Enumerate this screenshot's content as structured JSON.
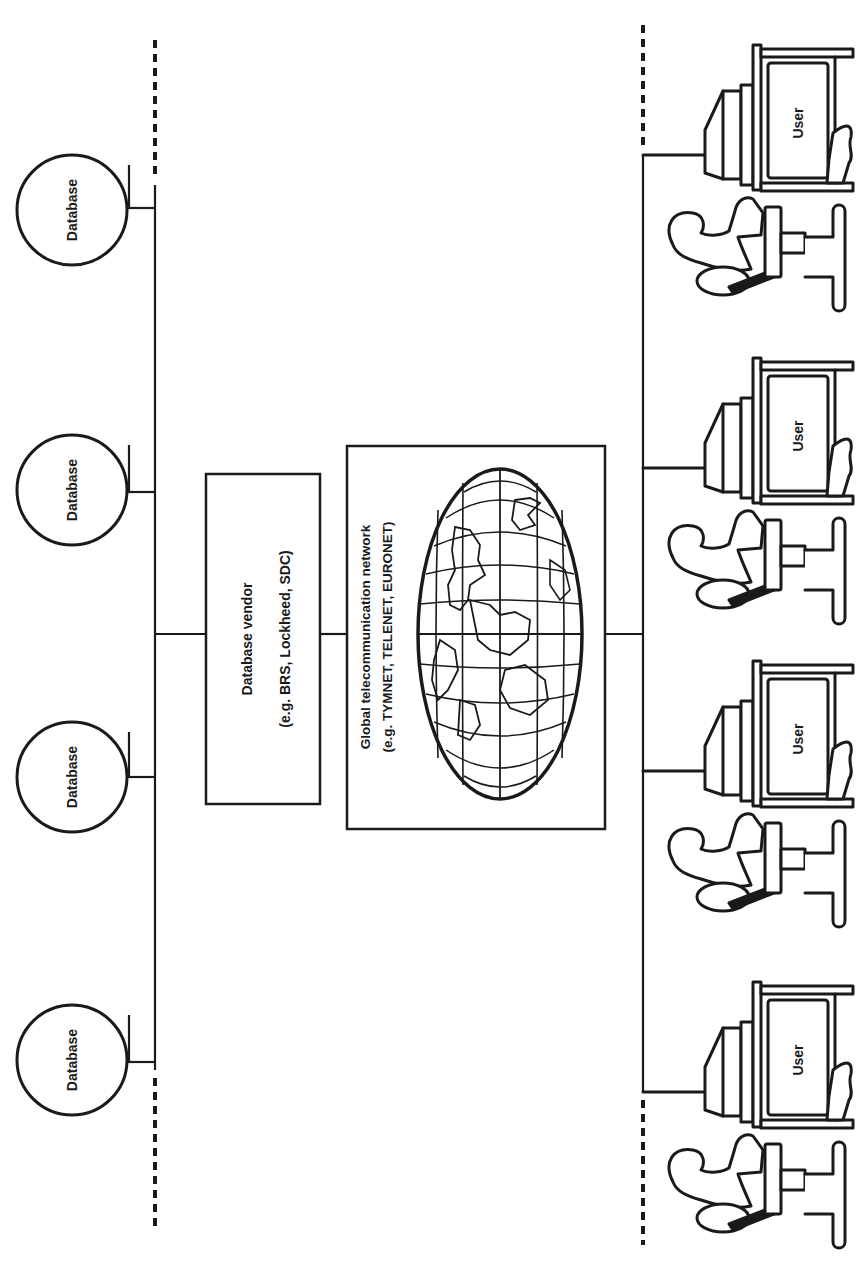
{
  "diagram": {
    "orientation": "rotated-90-ccw",
    "colors": {
      "ink": "#1a1a1a",
      "background": "#ffffff"
    },
    "databases": [
      {
        "label": "Database"
      },
      {
        "label": "Database"
      },
      {
        "label": "Database"
      },
      {
        "label": "Database"
      }
    ],
    "vendor": {
      "title": "Database vendor",
      "examples": "(e.g. BRS, Lockheed, SDC)"
    },
    "network": {
      "title": "Global telecommunication network",
      "examples": "(e.g. TYMNET, TELENET, EURONET)",
      "icon": "world-map-icon"
    },
    "users": [
      {
        "label": "User"
      },
      {
        "label": "User"
      },
      {
        "label": "User"
      },
      {
        "label": "User"
      }
    ]
  }
}
